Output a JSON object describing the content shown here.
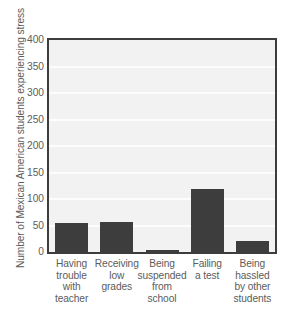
{
  "chart_data": {
    "type": "bar",
    "title": "",
    "subtitle": "",
    "xlabel": "",
    "ylabel": "Number of Mexican American students experiencing stress",
    "categories": [
      "Having trouble with teacher",
      "Receiving low grades",
      "Being suspended from school",
      "Failing a test",
      "Being hassled by other students"
    ],
    "category_lines": [
      [
        "Having",
        "trouble",
        "with",
        "teacher"
      ],
      [
        "Receiving",
        "low",
        "grades"
      ],
      [
        "Being",
        "suspended",
        "from",
        "school"
      ],
      [
        "Failing",
        "a test"
      ],
      [
        "Being",
        "hassled",
        "by other",
        "students"
      ]
    ],
    "values": [
      54,
      57,
      4,
      118,
      20
    ],
    "ylim": [
      0,
      400
    ],
    "ytick_values": [
      400,
      350,
      300,
      250,
      200,
      150,
      100,
      50,
      0
    ],
    "ytick_labels": [
      "400",
      "350",
      "300",
      "250",
      "200",
      "150",
      "100",
      "50",
      "0"
    ],
    "grid": true,
    "grid_axis": "y",
    "legend": "none",
    "colors": {
      "bar": "#3d3d3d",
      "plot_background": "#f2f2f2",
      "gridline": "#fdfdfd",
      "frame": "#3d3d3d",
      "text": "#5c5c5c",
      "page_background": "#ffffff"
    }
  }
}
